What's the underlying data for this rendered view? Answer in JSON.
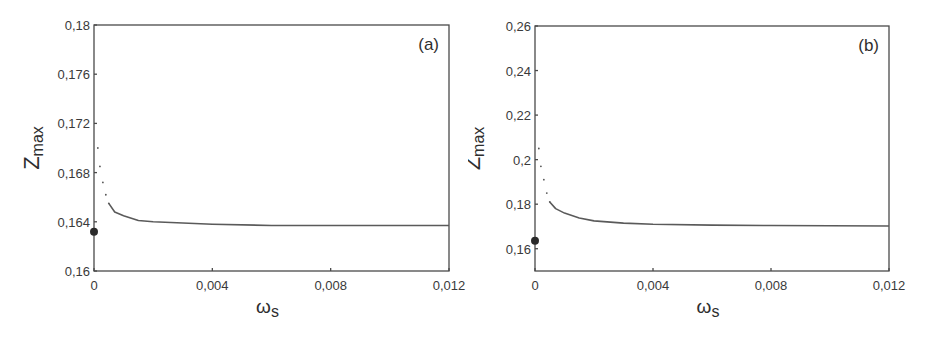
{
  "figure": {
    "panels": [
      {
        "id": "a",
        "label": "(a)",
        "ylabel_main": "Z",
        "ylabel_sub": "max",
        "xlabel_main": "ω",
        "xlabel_sub": "s"
      },
      {
        "id": "b",
        "label": "(b)",
        "ylabel_main": "Z",
        "ylabel_sub": "max",
        "xlabel_main": "ω",
        "xlabel_sub": "s"
      }
    ]
  },
  "chart_data": [
    {
      "type": "scatter",
      "title": "(a)",
      "xlabel": "ω_s",
      "ylabel": "Z_max",
      "xlim": [
        0,
        0.012
      ],
      "ylim": [
        0.16,
        0.18
      ],
      "xticks": [
        0,
        0.004,
        0.008,
        0.012
      ],
      "xtick_labels": [
        "0",
        "0,004",
        "0,008",
        "0,012"
      ],
      "yticks": [
        0.16,
        0.164,
        0.168,
        0.172,
        0.176,
        0.18
      ],
      "ytick_labels": [
        "0,16",
        "0,164",
        "0,168",
        "0,172",
        "0,176",
        "0,18"
      ],
      "grid": false,
      "series": [
        {
          "name": "Z_max(ω_s)",
          "style": "dotted-curve",
          "x": [
            0.00013,
            0.0002,
            0.0003,
            0.0004,
            0.0005,
            0.0007,
            0.001,
            0.0015,
            0.002,
            0.003,
            0.004,
            0.006,
            0.008,
            0.01,
            0.012
          ],
          "y": [
            0.17,
            0.1685,
            0.1672,
            0.1662,
            0.1655,
            0.1648,
            0.1645,
            0.1641,
            0.164,
            0.1639,
            0.1638,
            0.1637,
            0.1637,
            0.1637,
            0.1637
          ]
        },
        {
          "name": "ω_s = 0 value",
          "style": "filled-marker",
          "x": [
            0
          ],
          "y": [
            0.1632
          ]
        }
      ],
      "annotations": [
        "(a)"
      ]
    },
    {
      "type": "scatter",
      "title": "(b)",
      "xlabel": "ω_s",
      "ylabel": "Z_max",
      "xlim": [
        0,
        0.012
      ],
      "ylim": [
        0.15,
        0.26
      ],
      "xticks": [
        0,
        0.004,
        0.008,
        0.012
      ],
      "xtick_labels": [
        "0",
        "0,004",
        "0,008",
        "0,012"
      ],
      "yticks": [
        0.16,
        0.18,
        0.2,
        0.22,
        0.24,
        0.26
      ],
      "ytick_labels": [
        "0,16",
        "0,18",
        "0,2",
        "0,22",
        "0,24",
        "0,26"
      ],
      "grid": false,
      "series": [
        {
          "name": "Z_max(ω_s)",
          "style": "dotted-curve",
          "x": [
            0.00013,
            0.0002,
            0.0003,
            0.0004,
            0.0005,
            0.0007,
            0.001,
            0.0015,
            0.002,
            0.003,
            0.004,
            0.006,
            0.008,
            0.01,
            0.012
          ],
          "y": [
            0.205,
            0.197,
            0.191,
            0.185,
            0.181,
            0.178,
            0.176,
            0.1738,
            0.1725,
            0.1715,
            0.171,
            0.1706,
            0.1704,
            0.1703,
            0.1702
          ]
        },
        {
          "name": "ω_s = 0 value",
          "style": "filled-marker",
          "x": [
            0
          ],
          "y": [
            0.1636
          ]
        }
      ],
      "annotations": [
        "(b)"
      ]
    }
  ]
}
